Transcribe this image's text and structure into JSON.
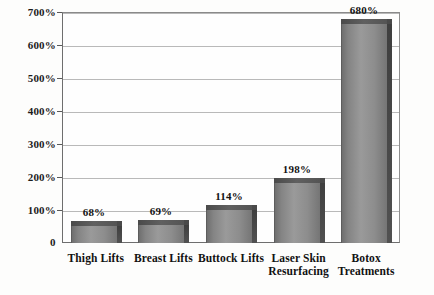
{
  "chart_data": {
    "type": "bar",
    "title": "",
    "xlabel": "",
    "ylabel": "",
    "categories": [
      "Thigh Lifts",
      "Breast Lifts",
      "Buttock Lifts",
      "Laser Skin\nResurfacing",
      "Botox\nTreatments"
    ],
    "values": [
      68,
      69,
      114,
      198,
      680
    ],
    "value_labels": [
      "68%",
      "69%",
      "114%",
      "198%",
      "680%"
    ],
    "ylim": [
      0,
      700
    ],
    "ytick_values": [
      0,
      100,
      200,
      300,
      400,
      500,
      600,
      700
    ],
    "ytick_labels": [
      "0",
      "100%",
      "200%",
      "300%",
      "400%",
      "500%",
      "600%",
      "700%"
    ],
    "grid": true,
    "legend": false,
    "bar_style": "3d-block-gray",
    "colors": {
      "bar_front": "#8d8d8d",
      "bar_top": "#545454",
      "bar_side": "#4a4a4a",
      "gridline": "#b9b9b9",
      "frame": "#6e6e6e",
      "text": "#121212",
      "background": "#fdfdfc"
    }
  }
}
